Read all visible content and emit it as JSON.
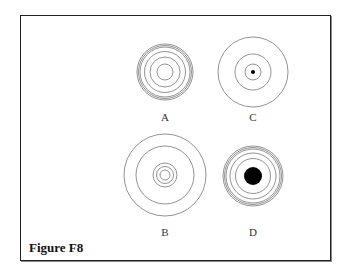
{
  "figure": {
    "caption": "Figure F8",
    "panels": [
      {
        "id": "A",
        "label": "A",
        "cx": 165,
        "cy": 72,
        "rings": [
          28,
          26.5,
          25,
          20.5,
          15,
          8
        ],
        "dot": 0
      },
      {
        "id": "C",
        "label": "C",
        "cx": 253,
        "cy": 72,
        "rings": [
          35,
          18,
          8
        ],
        "dot": 2
      },
      {
        "id": "B",
        "label": "B",
        "cx": 165,
        "cy": 175,
        "rings": [
          41,
          29,
          12,
          8.5,
          5
        ],
        "dot": 0
      },
      {
        "id": "D",
        "label": "D",
        "cx": 253,
        "cy": 176,
        "rings": [
          30,
          28.5,
          27,
          23,
          17.5
        ],
        "dot": 9
      }
    ],
    "stroke_color": "#777777",
    "fill_color": "#000000"
  }
}
